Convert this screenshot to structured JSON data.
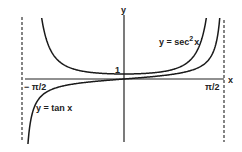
{
  "figure": {
    "axis_labels": {
      "x": "x",
      "y": "y"
    },
    "tick_labels": {
      "left": "− π/2",
      "right": "π/2",
      "one": "1"
    },
    "curve_labels": {
      "tan": "y = tan x",
      "sec2_base": "y = sec",
      "sec2_exp": "2",
      "sec2_tail": "x"
    },
    "colors": {
      "ink": "#1a1a1a",
      "background": "#ffffff"
    }
  },
  "chart_data": {
    "type": "line",
    "title": "",
    "xlabel": "x",
    "ylabel": "y",
    "xlim": [
      -1.5708,
      1.5708
    ],
    "x_ticks": [
      "-π/2",
      "π/2"
    ],
    "y_ticks": [
      "1"
    ],
    "asymptotes": [
      "x = -π/2",
      "x = π/2"
    ],
    "series": [
      {
        "name": "y = tan x",
        "function": "tan(x)",
        "x": [
          -1.5,
          -1.2,
          -0.8,
          -0.4,
          0,
          0.4,
          0.8,
          1.2,
          1.5
        ],
        "values": [
          -14.1,
          -2.57,
          -1.03,
          -0.42,
          0,
          0.42,
          1.03,
          2.57,
          14.1
        ]
      },
      {
        "name": "y = sec^2 x",
        "function": "sec^2(x)",
        "x": [
          -1.5,
          -1.2,
          -0.8,
          -0.4,
          0,
          0.4,
          0.8,
          1.2,
          1.5
        ],
        "values": [
          199.9,
          7.6,
          2.06,
          1.18,
          1,
          1.18,
          2.06,
          7.6,
          199.9
        ]
      }
    ],
    "grid": false,
    "legend": "inline labels"
  }
}
